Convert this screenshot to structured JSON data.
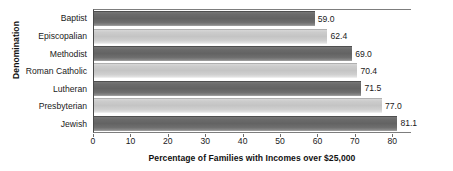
{
  "chart_data": {
    "type": "bar",
    "orientation": "horizontal",
    "title": "",
    "xlabel": "Percentage of Families with Incomes over $25,000",
    "ylabel": "Denomination",
    "categories": [
      "Baptist",
      "Episcopalian",
      "Methodist",
      "Roman Catholic",
      "Lutheran",
      "Presbyterian",
      "Jewish"
    ],
    "values": [
      59.0,
      62.4,
      69.0,
      70.4,
      71.5,
      77.0,
      81.1
    ],
    "value_labels": [
      "59.0",
      "62.4",
      "69.0",
      "70.4",
      "71.5",
      "77.0",
      "81.1"
    ],
    "bar_styles": [
      "dark",
      "light",
      "dark",
      "light",
      "dark",
      "light",
      "dark"
    ],
    "xlim": [
      0,
      85
    ],
    "xticks": [
      0,
      10,
      20,
      30,
      40,
      50,
      60,
      70,
      80
    ],
    "xtick_labels": [
      "0",
      "10",
      "20",
      "30",
      "40",
      "50",
      "60",
      "70",
      "80"
    ],
    "grid": false,
    "legend": false,
    "colors": {
      "bar_dark": "#636363",
      "bar_light": "#c4c4c4",
      "axis": "#4a4a4a",
      "text": "#1a1a1a",
      "background": "#ffffff"
    }
  }
}
